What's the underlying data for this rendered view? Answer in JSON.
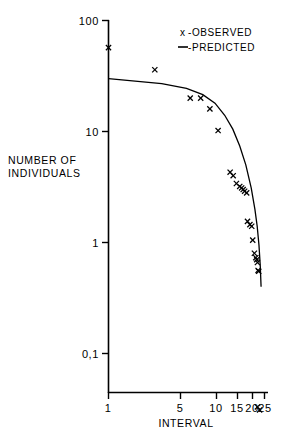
{
  "chart_data": {
    "type": "scatter",
    "title": "",
    "xlabel": "INTERVAL",
    "ylabel": "NUMBER OF INDIVIDUALS",
    "ylabel_line1": "NUMBER OF",
    "ylabel_line2": "INDIVIDUALS",
    "xscale": "log",
    "yscale": "log",
    "xlim": [
      1,
      25
    ],
    "ylim": [
      0.025,
      100
    ],
    "grid": false,
    "xticks": [
      1,
      5,
      10,
      15,
      20,
      25
    ],
    "xticklabels": [
      "1",
      "5",
      "10",
      "15",
      "20",
      "25"
    ],
    "yticks": [
      100,
      10,
      1,
      0.1
    ],
    "yticklabels": [
      "100",
      "10",
      "1",
      "0,1"
    ],
    "legend_position": "top-right",
    "legend": [
      {
        "marker": "x",
        "symbol": "x",
        "label": "-OBSERVED"
      },
      {
        "marker": "line",
        "symbol": "—",
        "label": "-PREDICTED"
      }
    ],
    "series": [
      {
        "name": "OBSERVED",
        "marker": "x",
        "color": "#000000",
        "points": [
          {
            "x": 1.0,
            "y": 57
          },
          {
            "x": 2.6,
            "y": 36
          },
          {
            "x": 5.4,
            "y": 20
          },
          {
            "x": 6.7,
            "y": 20
          },
          {
            "x": 8.1,
            "y": 16
          },
          {
            "x": 9.6,
            "y": 10.2
          },
          {
            "x": 12.3,
            "y": 4.3
          },
          {
            "x": 13.1,
            "y": 4.0
          },
          {
            "x": 14.0,
            "y": 3.4
          },
          {
            "x": 15.0,
            "y": 3.2
          },
          {
            "x": 15.6,
            "y": 3.1
          },
          {
            "x": 16.1,
            "y": 3.0
          },
          {
            "x": 16.6,
            "y": 2.9
          },
          {
            "x": 17.3,
            "y": 2.8
          },
          {
            "x": 17.6,
            "y": 1.55
          },
          {
            "x": 18.5,
            "y": 1.45
          },
          {
            "x": 19.2,
            "y": 1.4
          },
          {
            "x": 19.6,
            "y": 1.05
          },
          {
            "x": 20.3,
            "y": 0.8
          },
          {
            "x": 20.9,
            "y": 0.73
          },
          {
            "x": 21.3,
            "y": 0.7
          },
          {
            "x": 21.6,
            "y": 0.66
          },
          {
            "x": 21.9,
            "y": 0.56
          },
          {
            "x": 22.2,
            "y": 0.55
          },
          {
            "x": 21.6,
            "y": 0.033
          },
          {
            "x": 22.6,
            "y": 0.031
          }
        ]
      },
      {
        "name": "PREDICTED",
        "marker": "line",
        "color": "#000000",
        "points": [
          {
            "x": 1.0,
            "y": 30.0
          },
          {
            "x": 3.0,
            "y": 27.0
          },
          {
            "x": 5.0,
            "y": 24.5
          },
          {
            "x": 7.0,
            "y": 21.5
          },
          {
            "x": 9.0,
            "y": 18.0
          },
          {
            "x": 11.0,
            "y": 14.0
          },
          {
            "x": 13.0,
            "y": 10.5
          },
          {
            "x": 15.0,
            "y": 7.4
          },
          {
            "x": 17.0,
            "y": 5.0
          },
          {
            "x": 19.0,
            "y": 3.1
          },
          {
            "x": 20.5,
            "y": 2.0
          },
          {
            "x": 21.5,
            "y": 1.4
          },
          {
            "x": 22.3,
            "y": 0.95
          },
          {
            "x": 22.9,
            "y": 0.62
          },
          {
            "x": 23.3,
            "y": 0.4
          }
        ]
      }
    ]
  },
  "axes": {
    "x_axis_name": "interval-axis",
    "y_axis_name": "number-of-individuals-axis"
  }
}
